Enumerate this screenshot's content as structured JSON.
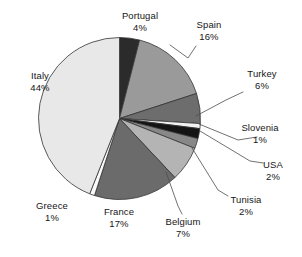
{
  "chart_data": {
    "type": "pie",
    "title": "",
    "subtitle": "",
    "xlabel": "",
    "ylabel": "",
    "legend": "none",
    "grid": false,
    "labels_show_percent": true,
    "start_angle_deg": -90,
    "direction": "clockwise",
    "categories": [
      "Portugal",
      "Spain",
      "Turkey",
      "Slovenia",
      "USA",
      "Tunisia",
      "Belgium",
      "France",
      "Greece",
      "Italy"
    ],
    "values": [
      4,
      16,
      6,
      1,
      2,
      2,
      7,
      17,
      1,
      44
    ],
    "unit": "%",
    "colors": [
      "#2b2b2b",
      "#9a9a9a",
      "#6d6d6d",
      "#f2f2f2",
      "#141414",
      "#888888",
      "#b4b4b4",
      "#6b6b6b",
      "#fafafa",
      "#e8e8e8"
    ],
    "slices": [
      {
        "name": "Portugal",
        "value": 4,
        "percent_label": "4%",
        "color": "#2b2b2b"
      },
      {
        "name": "Spain",
        "value": 16,
        "percent_label": "16%",
        "color": "#9a9a9a"
      },
      {
        "name": "Turkey",
        "value": 6,
        "percent_label": "6%",
        "color": "#6d6d6d"
      },
      {
        "name": "Slovenia",
        "value": 1,
        "percent_label": "1%",
        "color": "#f2f2f2"
      },
      {
        "name": "USA",
        "value": 2,
        "percent_label": "2%",
        "color": "#141414"
      },
      {
        "name": "Tunisia",
        "value": 2,
        "percent_label": "2%",
        "color": "#888888"
      },
      {
        "name": "Belgium",
        "value": 7,
        "percent_label": "7%",
        "color": "#b4b4b4"
      },
      {
        "name": "France",
        "value": 17,
        "percent_label": "17%",
        "color": "#6b6b6b"
      },
      {
        "name": "Greece",
        "value": 1,
        "percent_label": "1%",
        "color": "#fafafa"
      },
      {
        "name": "Italy",
        "value": 44,
        "percent_label": "44%",
        "color": "#e8e8e8"
      }
    ]
  },
  "labels": {
    "portugal": {
      "name": "Portugal",
      "percent": "4%"
    },
    "spain": {
      "name": "Spain",
      "percent": "16%"
    },
    "turkey": {
      "name": "Turkey",
      "percent": "6%"
    },
    "slovenia": {
      "name": "Slovenia",
      "percent": "1%"
    },
    "usa": {
      "name": "USA",
      "percent": "2%"
    },
    "tunisia": {
      "name": "Tunisia",
      "percent": "2%"
    },
    "belgium": {
      "name": "Belgium",
      "percent": "7%"
    },
    "france": {
      "name": "France",
      "percent": "17%"
    },
    "greece": {
      "name": "Greece",
      "percent": "1%"
    },
    "italy": {
      "name": "Italy",
      "percent": "44%"
    }
  },
  "style": {
    "background": "#ffffff",
    "outline": "#333333",
    "leader_line": "#4d4d4d",
    "text": "#161616"
  }
}
